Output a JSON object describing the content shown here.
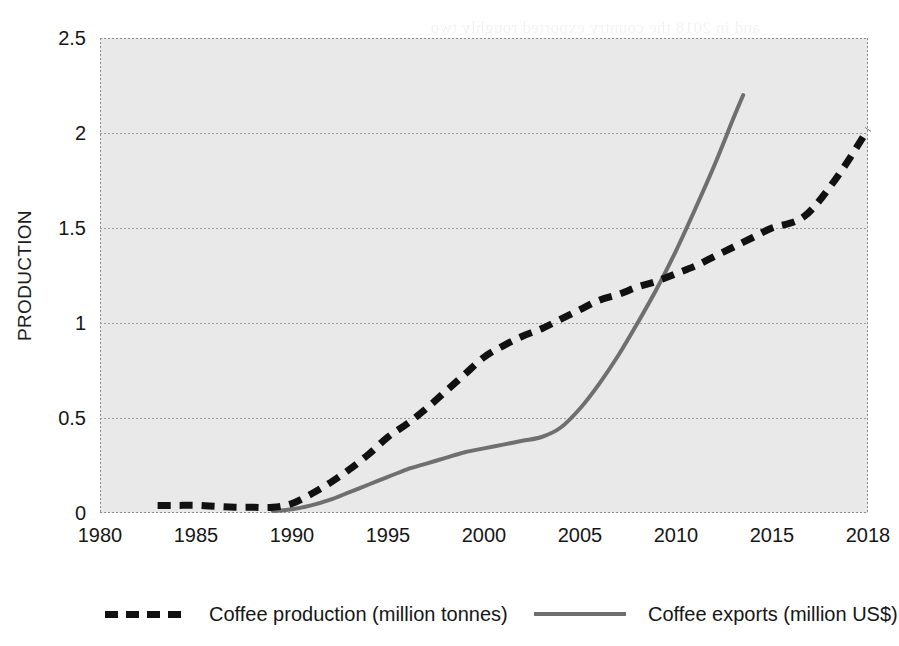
{
  "chart_data": {
    "type": "line",
    "title": "",
    "xlabel": "",
    "ylabel": "PRODUCTION",
    "xlim": [
      1980,
      2018
    ],
    "ylim": [
      0,
      2.5
    ],
    "grid": true,
    "legend_position": "bottom",
    "x_tick_labels": [
      "1980",
      "1985",
      "1990",
      "1995",
      "2000",
      "2005",
      "2010",
      "2015",
      "2018"
    ],
    "x_ticks": [
      1980,
      1985,
      1990,
      1995,
      2000,
      2005,
      2010,
      2015,
      2018
    ],
    "y_tick_labels": [
      "0",
      "0.5",
      "1",
      "1.5",
      "2",
      "2.5"
    ],
    "y_ticks": [
      0,
      0.5,
      1,
      1.5,
      2,
      2.5
    ],
    "series": [
      {
        "name": "Coffee production (million tonnes)",
        "style": "dashed",
        "color": "#111111",
        "x": [
          1983,
          1984,
          1985,
          1986,
          1987,
          1988,
          1989,
          1990,
          1991,
          1992,
          1993,
          1994,
          1995,
          1996,
          1997,
          1998,
          1999,
          2000,
          2001,
          2002,
          2003,
          2004,
          2005,
          2006,
          2007,
          2008,
          2009,
          2010,
          2011,
          2012,
          2013,
          2014,
          2015,
          2016,
          2017,
          2018
        ],
        "values": [
          0.04,
          0.04,
          0.04,
          0.035,
          0.03,
          0.03,
          0.03,
          0.05,
          0.1,
          0.16,
          0.23,
          0.31,
          0.4,
          0.47,
          0.55,
          0.64,
          0.73,
          0.82,
          0.88,
          0.93,
          0.97,
          1.02,
          1.07,
          1.12,
          1.15,
          1.19,
          1.22,
          1.26,
          1.3,
          1.35,
          1.4,
          1.45,
          1.5,
          1.56,
          1.76,
          2.02
        ]
      },
      {
        "name": "Coffee exports (million US$)",
        "style": "solid",
        "color": "#6f6f6f",
        "x": [
          1989,
          1990,
          1991,
          1992,
          1993,
          1994,
          1995,
          1996,
          1997,
          1998,
          1999,
          2000,
          2001,
          2002,
          2003,
          2004,
          2005,
          2006,
          2007,
          2008,
          2009,
          2010,
          2011,
          2012,
          2013,
          2013.5
        ],
        "values": [
          0.01,
          0.02,
          0.04,
          0.07,
          0.11,
          0.15,
          0.19,
          0.23,
          0.26,
          0.29,
          0.32,
          0.34,
          0.36,
          0.38,
          0.4,
          0.45,
          0.55,
          0.68,
          0.83,
          1.0,
          1.18,
          1.38,
          1.6,
          1.83,
          2.08,
          2.2
        ]
      }
    ]
  },
  "legend": {
    "entries": [
      {
        "label": "Coffee production (million tonnes)",
        "style": "dashed"
      },
      {
        "label": "Coffee exports (million US$)",
        "style": "solid"
      }
    ]
  },
  "bleed_text": {
    "lines": [
      "and in 2018 the country exported roughly two",
      "the production of green coffee beans the",
      "regions where coffee is grown in the",
      "are the main growing areas of the country",
      "value added products such as instant coffee",
      "international market prices remain the key",
      "to expand the area under cultivation",
      "with the support of smallholder farmers"
    ]
  }
}
